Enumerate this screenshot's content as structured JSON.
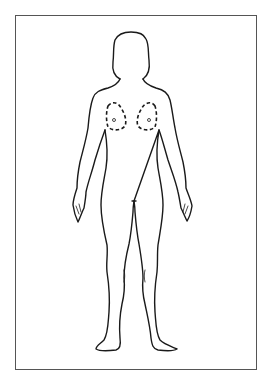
{
  "diagram": {
    "title": "",
    "annotations": [
      {
        "region": "left-breast",
        "style": "dashed-outline"
      },
      {
        "region": "right-breast",
        "style": "dashed-outline"
      }
    ],
    "colors": {
      "stroke": "#1a1a1a",
      "frame": "#555555",
      "background": "#ffffff"
    }
  }
}
